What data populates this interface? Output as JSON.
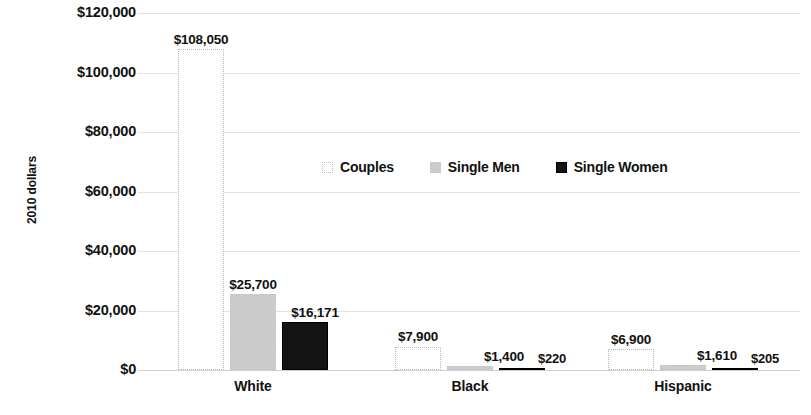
{
  "chart_data": {
    "type": "bar",
    "title": "",
    "xlabel": "",
    "ylabel": "2010 dollars",
    "ylim": [
      0,
      120000
    ],
    "ytick_labels": [
      "$120,000",
      "$100,000",
      "$80,000",
      "$60,000",
      "$40,000",
      "$20,000",
      "$0"
    ],
    "ytick_values": [
      120000,
      100000,
      80000,
      60000,
      40000,
      20000,
      0
    ],
    "grid": true,
    "legend_position": "center",
    "categories": [
      "White",
      "Black",
      "Hispanic"
    ],
    "series": [
      {
        "name": "Couples",
        "values": [
          108050,
          7900,
          6900
        ],
        "value_labels": [
          "$108,050",
          "$7,900",
          "$6,900"
        ],
        "color": "#ffffff",
        "border": "#b9b9b9"
      },
      {
        "name": "Single Men",
        "values": [
          25700,
          1400,
          1610
        ],
        "value_labels": [
          "$25,700",
          "$1,400",
          "$1,610"
        ],
        "color": "#d2d2d2",
        "border": "#c8c8c8"
      },
      {
        "name": "Single Women",
        "values": [
          16171,
          220,
          205
        ],
        "value_labels": [
          "$16,171",
          "$220",
          "$205"
        ],
        "color": "#141414",
        "border": "#000000"
      }
    ]
  },
  "legend": {
    "items": [
      {
        "label": "Couples",
        "swatch": "couples"
      },
      {
        "label": "Single Men",
        "swatch": "men"
      },
      {
        "label": "Single Women",
        "swatch": "women"
      }
    ]
  }
}
